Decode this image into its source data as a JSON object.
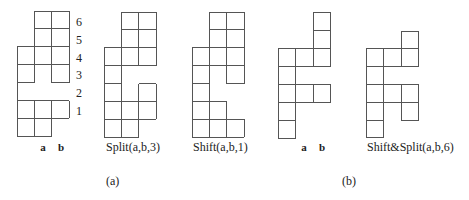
{
  "figures": [
    {
      "id": "original-a",
      "x0": 17,
      "y0": 11,
      "cw": 17.4,
      "ch": 17.9,
      "cells": [
        [
          0,
          1
        ],
        [
          0,
          2
        ],
        [
          1,
          1
        ],
        [
          1,
          2
        ],
        [
          2,
          0
        ],
        [
          2,
          1
        ],
        [
          2,
          2
        ],
        [
          3,
          0
        ],
        [
          3,
          1
        ],
        [
          3,
          2
        ],
        [
          4,
          0
        ],
        [
          5,
          0
        ],
        [
          5,
          1
        ],
        [
          5,
          2
        ],
        [
          6,
          0
        ],
        [
          6,
          1
        ]
      ],
      "open_edges": [
        [
          "b",
          3,
          1
        ],
        [
          "t",
          4,
          1
        ],
        [
          "r",
          4,
          0
        ]
      ],
      "col_labels": [
        {
          "text": "a",
          "x": 43
        },
        {
          "text": "b",
          "x": 61
        }
      ],
      "row_labels": [
        {
          "text": "6",
          "y": 22
        },
        {
          "text": "5",
          "y": 40
        },
        {
          "text": "4",
          "y": 58
        },
        {
          "text": "3",
          "y": 75
        },
        {
          "text": "2",
          "y": 93
        },
        {
          "text": "1",
          "y": 111
        }
      ],
      "row_label_x": 76,
      "caption": ""
    },
    {
      "id": "split-a-b-3",
      "x0": 104,
      "y0": 12,
      "cw": 17.4,
      "ch": 17.9,
      "cells": [
        [
          0,
          1
        ],
        [
          0,
          2
        ],
        [
          1,
          1
        ],
        [
          1,
          2
        ],
        [
          2,
          0
        ],
        [
          2,
          1
        ],
        [
          2,
          2
        ],
        [
          3,
          0
        ],
        [
          4,
          0
        ],
        [
          4,
          2
        ],
        [
          5,
          0
        ],
        [
          5,
          1
        ],
        [
          5,
          2
        ],
        [
          6,
          0
        ],
        [
          6,
          1
        ]
      ],
      "caption": "Split(a,b,3)",
      "caption_x": 106
    },
    {
      "id": "shift-a-b-1",
      "x0": 192,
      "y0": 12,
      "cw": 17.4,
      "ch": 17.9,
      "cells": [
        [
          0,
          1
        ],
        [
          0,
          2
        ],
        [
          1,
          1
        ],
        [
          1,
          2
        ],
        [
          2,
          0
        ],
        [
          2,
          1
        ],
        [
          2,
          2
        ],
        [
          3,
          0
        ],
        [
          3,
          1
        ],
        [
          3,
          2
        ],
        [
          4,
          0
        ],
        [
          5,
          0
        ],
        [
          5,
          1
        ],
        [
          6,
          0
        ],
        [
          6,
          1
        ],
        [
          6,
          2
        ]
      ],
      "open_edges": [
        [
          "b",
          3,
          1
        ]
      ],
      "caption": "Shift(a,b,1)",
      "caption_x": 193
    },
    {
      "id": "original-b",
      "x0": 278,
      "y0": 12,
      "cw": 17.6,
      "ch": 18,
      "cells": [
        [
          0,
          2
        ],
        [
          1,
          2
        ],
        [
          2,
          0
        ],
        [
          2,
          1
        ],
        [
          2,
          2
        ],
        [
          3,
          0
        ],
        [
          4,
          0
        ],
        [
          4,
          1
        ],
        [
          4,
          2
        ],
        [
          5,
          0
        ],
        [
          6,
          0
        ]
      ],
      "col_labels": [
        {
          "text": "a",
          "x": 304
        },
        {
          "text": "b",
          "x": 322
        }
      ],
      "caption": ""
    },
    {
      "id": "shift-split-a-b-6",
      "x0": 366,
      "y0": 31,
      "cw": 17.6,
      "ch": 17.8,
      "cells": [
        [
          0,
          2
        ],
        [
          1,
          0
        ],
        [
          1,
          1
        ],
        [
          1,
          2
        ],
        [
          2,
          0
        ],
        [
          3,
          0
        ],
        [
          3,
          1
        ],
        [
          3,
          2
        ],
        [
          4,
          0
        ],
        [
          4,
          2
        ],
        [
          5,
          0
        ]
      ],
      "caption": "Shift&Split(a,b,6)",
      "caption_x": 367
    }
  ],
  "captions": {
    "a": {
      "text": "(a)",
      "x": 106,
      "y": 185
    },
    "b": {
      "text": "(b)",
      "x": 342,
      "y": 185
    }
  },
  "labels_y": 151,
  "colors": {
    "line": "#555555",
    "text": "#222222",
    "background": "#ffffff"
  }
}
